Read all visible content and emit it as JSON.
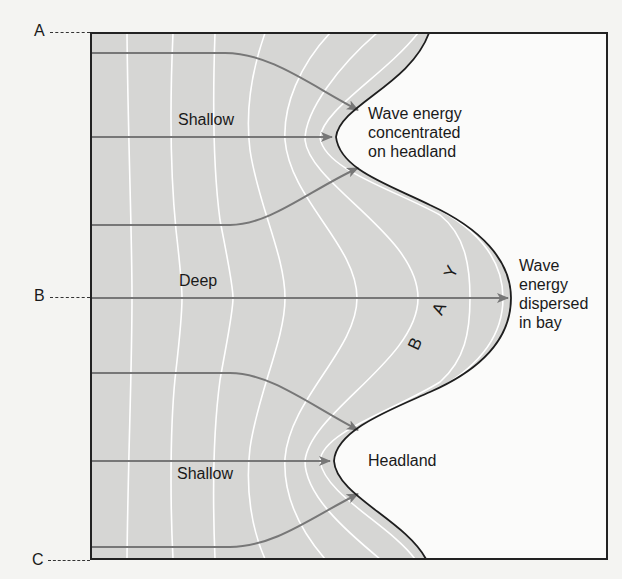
{
  "figure": {
    "colors": {
      "water": "#d6d6d4",
      "land": "#fbfbfa",
      "coastline": "#1e1e1e",
      "wave_crest": "#ffffff",
      "orthogonal_arrow": "#777777",
      "frame": "#222222"
    }
  },
  "side_markers": [
    {
      "id": "A",
      "label": "A"
    },
    {
      "id": "B",
      "label": "B"
    },
    {
      "id": "C",
      "label": "C"
    }
  ],
  "zones": {
    "shallow_top": "Shallow",
    "deep": "Deep",
    "shallow_bottom": "Shallow"
  },
  "annotations": {
    "headland_top": "Wave energy\nconcentrated\non headland",
    "bay": "Wave\nenergy\ndispersed\nin bay",
    "headland_bottom": "Headland"
  },
  "bay_letters": [
    "B",
    "A",
    "Y"
  ],
  "elements": {
    "wave_crests": 8,
    "orthogonals": 7
  }
}
